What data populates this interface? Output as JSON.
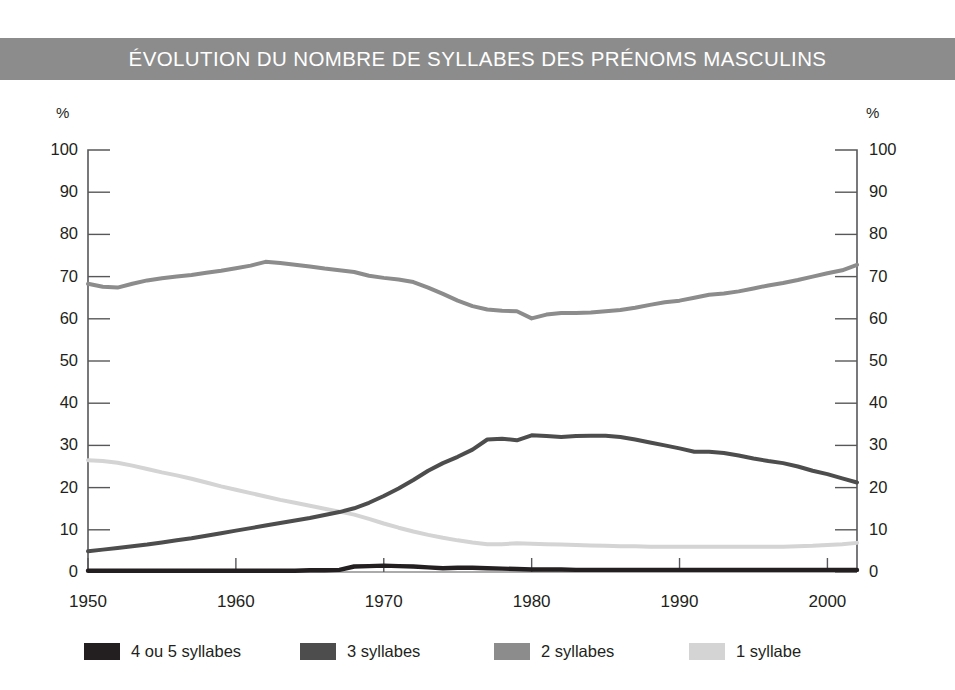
{
  "header": {
    "title": "ÉVOLUTION DU NOMBRE DE SYLLABES DES PRÉNOMS MASCULINS",
    "banner_color": "#8c8c8c",
    "title_color": "#ffffff"
  },
  "axes": {
    "left_unit": "%",
    "right_unit": "%",
    "y_ticks": [
      "100",
      "90",
      "80",
      "70",
      "60",
      "50",
      "40",
      "30",
      "20",
      "10",
      "0"
    ],
    "x_ticks": [
      "1950",
      "1960",
      "1970",
      "1980",
      "1990",
      "2000"
    ]
  },
  "legend": {
    "items": [
      {
        "label": "4 ou 5 syllabes",
        "color": "#231f20"
      },
      {
        "label": "3 syllabes",
        "color": "#4d4d4d"
      },
      {
        "label": "2 syllabes",
        "color": "#8c8c8c"
      },
      {
        "label": "1 syllabe",
        "color": "#d4d4d4"
      }
    ]
  },
  "chart_data": {
    "type": "line",
    "title": "ÉVOLUTION DU NOMBRE DE SYLLABES DES PRÉNOMS MASCULINS",
    "xlabel": "",
    "ylabel": "%",
    "xlim": [
      1950,
      2002
    ],
    "ylim": [
      0,
      100
    ],
    "grid": false,
    "legend_position": "bottom",
    "x": [
      1950,
      1951,
      1952,
      1953,
      1954,
      1955,
      1956,
      1957,
      1958,
      1959,
      1960,
      1961,
      1962,
      1963,
      1964,
      1965,
      1966,
      1967,
      1968,
      1969,
      1970,
      1971,
      1972,
      1973,
      1974,
      1975,
      1976,
      1977,
      1978,
      1979,
      1980,
      1981,
      1982,
      1983,
      1984,
      1985,
      1986,
      1987,
      1988,
      1989,
      1990,
      1991,
      1992,
      1993,
      1994,
      1995,
      1996,
      1997,
      1998,
      1999,
      2000,
      2001,
      2002
    ],
    "series": [
      {
        "name": "2 syllabes",
        "color": "#8c8c8c",
        "values": [
          68.3,
          67.6,
          67.4,
          68.3,
          69.1,
          69.6,
          70.0,
          70.4,
          70.9,
          71.4,
          72.0,
          72.6,
          73.5,
          73.2,
          72.8,
          72.4,
          71.9,
          71.5,
          71.1,
          70.2,
          69.7,
          69.3,
          68.7,
          67.4,
          65.9,
          64.3,
          63.0,
          62.2,
          61.9,
          61.8,
          60.1,
          61.0,
          61.4,
          61.4,
          61.5,
          61.8,
          62.1,
          62.6,
          63.3,
          63.9,
          64.3,
          65.0,
          65.7,
          66.0,
          66.5,
          67.2,
          67.9,
          68.5,
          69.2,
          70.0,
          70.8,
          71.5,
          72.8
        ]
      },
      {
        "name": "3 syllabes",
        "color": "#4d4d4d",
        "values": [
          4.9,
          5.3,
          5.7,
          6.1,
          6.5,
          7.0,
          7.5,
          8.0,
          8.6,
          9.2,
          9.8,
          10.4,
          11.0,
          11.6,
          12.2,
          12.8,
          13.5,
          14.2,
          15.1,
          16.4,
          18.0,
          19.8,
          21.8,
          24.0,
          25.8,
          27.3,
          29.0,
          31.4,
          31.6,
          31.2,
          32.4,
          32.2,
          32.0,
          32.2,
          32.3,
          32.3,
          32.0,
          31.4,
          30.7,
          30.0,
          29.3,
          28.5,
          28.5,
          28.2,
          27.6,
          26.9,
          26.3,
          25.8,
          25.0,
          24.0,
          23.2,
          22.2,
          21.2
        ]
      },
      {
        "name": "1 syllabe",
        "color": "#d4d4d4",
        "values": [
          26.5,
          26.3,
          25.9,
          25.2,
          24.4,
          23.6,
          22.9,
          22.1,
          21.2,
          20.3,
          19.5,
          18.7,
          17.9,
          17.1,
          16.4,
          15.7,
          15.0,
          14.3,
          13.6,
          12.6,
          11.5,
          10.5,
          9.6,
          8.8,
          8.1,
          7.5,
          7.0,
          6.6,
          6.6,
          6.8,
          6.7,
          6.6,
          6.5,
          6.4,
          6.3,
          6.2,
          6.1,
          6.1,
          6.0,
          6.0,
          6.0,
          6.0,
          6.0,
          6.0,
          6.0,
          6.0,
          6.0,
          6.0,
          6.1,
          6.2,
          6.4,
          6.6,
          6.9
        ]
      },
      {
        "name": "4 ou 5 syllabes",
        "color": "#231f20",
        "values": [
          0.3,
          0.3,
          0.3,
          0.3,
          0.3,
          0.3,
          0.3,
          0.3,
          0.3,
          0.3,
          0.3,
          0.3,
          0.3,
          0.3,
          0.3,
          0.4,
          0.4,
          0.5,
          1.3,
          1.4,
          1.5,
          1.4,
          1.3,
          1.1,
          0.9,
          1.0,
          1.0,
          0.9,
          0.8,
          0.7,
          0.6,
          0.6,
          0.6,
          0.5,
          0.5,
          0.5,
          0.5,
          0.5,
          0.5,
          0.5,
          0.5,
          0.5,
          0.5,
          0.5,
          0.5,
          0.5,
          0.5,
          0.5,
          0.5,
          0.5,
          0.5,
          0.5,
          0.5
        ]
      }
    ]
  }
}
